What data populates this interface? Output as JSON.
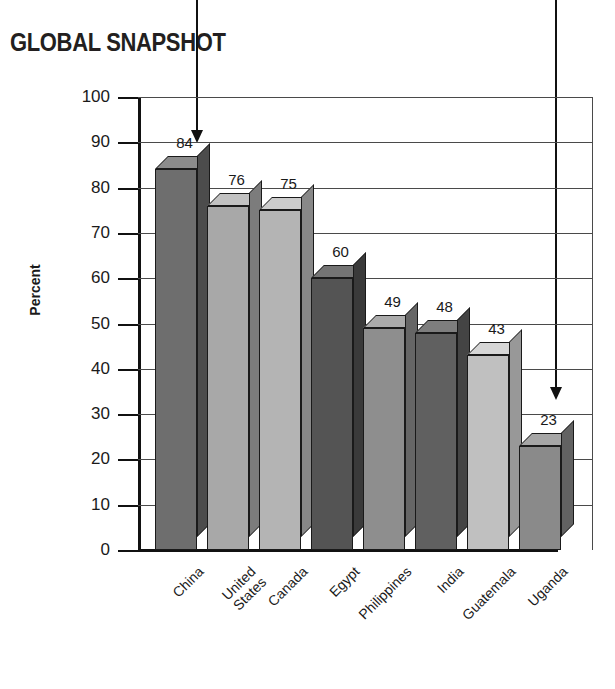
{
  "title": "GLOBAL SNAPSHOT",
  "annotations": {
    "arrow_left": {
      "name": "callout-arrow-left",
      "x": 196,
      "top": 0,
      "bottom": 143
    },
    "arrow_right": {
      "name": "callout-arrow-right",
      "x": 555,
      "top": 0,
      "bottom": 400
    }
  },
  "chart_data": {
    "type": "bar",
    "title": "GLOBAL SNAPSHOT",
    "xlabel": "",
    "ylabel": "Percent",
    "ylim": [
      0,
      100
    ],
    "ytick_step": 10,
    "yticks": [
      100,
      90,
      80,
      70,
      60,
      50,
      40,
      30,
      20,
      10,
      0
    ],
    "grid": true,
    "grid_axis": "y",
    "legend": "none",
    "style_3d": true,
    "categories": [
      "China",
      "United States",
      "Canada",
      "Egypt",
      "Philippines",
      "India",
      "Guatemala",
      "Uganda"
    ],
    "category_lines": [
      [
        "China"
      ],
      [
        "United",
        "States"
      ],
      [
        "Canada"
      ],
      [
        "Egypt"
      ],
      [
        "Philippines"
      ],
      [
        "India"
      ],
      [
        "Guatemala"
      ],
      [
        "Uganda"
      ]
    ],
    "values": [
      84,
      76,
      75,
      60,
      49,
      48,
      43,
      23
    ],
    "data_labels": [
      "84",
      "76",
      "75",
      "60",
      "49",
      "48",
      "43",
      "23"
    ],
    "bar_colors": [
      "#6e6e6e",
      "#a8a8a8",
      "#b4b4b4",
      "#545454",
      "#8e8e8e",
      "#606060",
      "#c0c0c0",
      "#8a8a8a"
    ],
    "bar_top_colors": [
      "#8c8c8c",
      "#c2c2c2",
      "#cccccc",
      "#747474",
      "#ababab",
      "#7e7e7e",
      "#d6d6d6",
      "#a6a6a6"
    ],
    "bar_side_colors": [
      "#4c4c4c",
      "#7c7c7c",
      "#888888",
      "#3a3a3a",
      "#666666",
      "#444444",
      "#989898",
      "#626262"
    ]
  }
}
